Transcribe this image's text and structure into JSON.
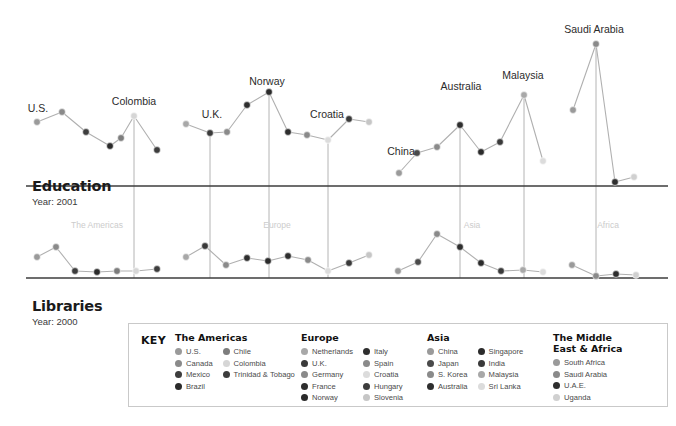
{
  "sections": {
    "education": {
      "title": "Education",
      "year_label": "Year: 2001"
    },
    "libraries": {
      "title": "Libraries",
      "year_label": "Year: 2000"
    }
  },
  "region_bands": [
    "The Americas",
    "Europe",
    "Asia",
    "Africa"
  ],
  "legend": {
    "key_label": "KEY",
    "groups": [
      {
        "heading": "The Americas",
        "columns": [
          [
            {
              "label": "U.S.",
              "color": "#9a9a9a"
            },
            {
              "label": "Canada",
              "color": "#8a8a8a"
            },
            {
              "label": "Mexico",
              "color": "#3d3d3d"
            },
            {
              "label": "Brazil",
              "color": "#2b2b2b"
            }
          ],
          [
            {
              "label": "Chile",
              "color": "#7d7d7d"
            },
            {
              "label": "Colombia",
              "color": "#d6d6d6"
            },
            {
              "label": "Trinidad & Tobago",
              "color": "#3d3d3d"
            }
          ]
        ]
      },
      {
        "heading": "Europe",
        "columns": [
          [
            {
              "label": "Netherlands",
              "color": "#a8a8a8"
            },
            {
              "label": "U.K.",
              "color": "#3a3a3a"
            },
            {
              "label": "Germany",
              "color": "#8a8a8a"
            },
            {
              "label": "France",
              "color": "#2e2e2e"
            },
            {
              "label": "Norway",
              "color": "#2b2b2b"
            }
          ],
          [
            {
              "label": "Italy",
              "color": "#2e2e2e"
            },
            {
              "label": "Spain",
              "color": "#8a8a8a"
            },
            {
              "label": "Croatia",
              "color": "#dcdcdc"
            },
            {
              "label": "Hungary",
              "color": "#3d3d3d"
            },
            {
              "label": "Slovenia",
              "color": "#c6c6c6"
            }
          ]
        ]
      },
      {
        "heading": "Asia",
        "columns": [
          [
            {
              "label": "China",
              "color": "#9a9a9a"
            },
            {
              "label": "Japan",
              "color": "#4a4a4a"
            },
            {
              "label": "S. Korea",
              "color": "#8a8a8a"
            },
            {
              "label": "Australia",
              "color": "#2e2e2e"
            }
          ],
          [
            {
              "label": "Singapore",
              "color": "#2b2b2b"
            },
            {
              "label": "India",
              "color": "#3a3a3a"
            },
            {
              "label": "Malaysia",
              "color": "#a8a8a8"
            },
            {
              "label": "Sri Lanka",
              "color": "#dcdcdc"
            }
          ]
        ]
      },
      {
        "heading": "The Middle\nEast & Africa",
        "columns": [
          [
            {
              "label": "South Africa",
              "color": "#9a9a9a"
            },
            {
              "label": "Saudi Arabia",
              "color": "#8a8a8a"
            },
            {
              "label": "U.A.E.",
              "color": "#2e2e2e"
            },
            {
              "label": "Uganda",
              "color": "#d0d0d0"
            }
          ]
        ]
      }
    ]
  },
  "chart_data": {
    "type": "line",
    "xlabel": "",
    "ylabel": "",
    "grid": true,
    "legend_position": "bottom",
    "annotations": [
      {
        "text": "U.S.",
        "x": 38,
        "y": 112
      },
      {
        "text": "Colombia",
        "x": 134,
        "y": 105
      },
      {
        "text": "U.K.",
        "x": 212,
        "y": 118
      },
      {
        "text": "Norway",
        "x": 267,
        "y": 85
      },
      {
        "text": "Croatia",
        "x": 327,
        "y": 118
      },
      {
        "text": "China",
        "x": 401,
        "y": 155
      },
      {
        "text": "Australia",
        "x": 461,
        "y": 90
      },
      {
        "text": "Malaysia",
        "x": 523,
        "y": 79
      },
      {
        "text": "Saudi Arabia",
        "x": 594,
        "y": 33
      }
    ],
    "series": [
      {
        "name": "Education",
        "year": 2001,
        "baseline_y": 186,
        "points": [
          {
            "country": "U.S.",
            "region": "The Americas",
            "x": 37,
            "y": 122,
            "color": "#9a9a9a",
            "value": 64
          },
          {
            "country": "Canada",
            "region": "The Americas",
            "x": 62,
            "y": 112,
            "color": "#8a8a8a",
            "value": 74
          },
          {
            "country": "Mexico",
            "region": "The Americas",
            "x": 86,
            "y": 132,
            "color": "#3d3d3d",
            "value": 54
          },
          {
            "country": "Brazil",
            "region": "The Americas",
            "x": 110,
            "y": 146,
            "color": "#2b2b2b",
            "value": 40
          },
          {
            "country": "Chile",
            "region": "The Americas",
            "x": 121,
            "y": 138,
            "color": "#7d7d7d",
            "value": 48
          },
          {
            "country": "Colombia",
            "region": "The Americas",
            "x": 134,
            "y": 116,
            "color": "#d6d6d6",
            "value": 70
          },
          {
            "country": "Trinidad & Tobago",
            "region": "The Americas",
            "x": 157,
            "y": 150,
            "color": "#3d3d3d",
            "value": 36
          },
          {
            "country": "Netherlands",
            "region": "Europe",
            "x": 186,
            "y": 124,
            "color": "#a8a8a8",
            "value": 62
          },
          {
            "country": "U.K.",
            "region": "Europe",
            "x": 210,
            "y": 133,
            "color": "#3a3a3a",
            "value": 53
          },
          {
            "country": "Germany",
            "region": "Europe",
            "x": 227,
            "y": 132,
            "color": "#8a8a8a",
            "value": 54
          },
          {
            "country": "France",
            "region": "Europe",
            "x": 247,
            "y": 105,
            "color": "#2e2e2e",
            "value": 81
          },
          {
            "country": "Norway",
            "region": "Europe",
            "x": 269,
            "y": 92,
            "color": "#2b2b2b",
            "value": 94
          },
          {
            "country": "Italy",
            "region": "Europe",
            "x": 288,
            "y": 132,
            "color": "#2e2e2e",
            "value": 54
          },
          {
            "country": "Spain",
            "region": "Europe",
            "x": 307,
            "y": 135,
            "color": "#8a8a8a",
            "value": 51
          },
          {
            "country": "Croatia",
            "region": "Europe",
            "x": 328,
            "y": 140,
            "color": "#dcdcdc",
            "value": 46
          },
          {
            "country": "Hungary",
            "region": "Europe",
            "x": 349,
            "y": 119,
            "color": "#3a3a3a",
            "value": 67
          },
          {
            "country": "Slovenia",
            "region": "Europe",
            "x": 369,
            "y": 122,
            "color": "#c6c6c6",
            "value": 64
          },
          {
            "country": "China",
            "region": "Asia",
            "x": 399,
            "y": 173,
            "color": "#9a9a9a",
            "value": 13
          },
          {
            "country": "Japan",
            "region": "Asia",
            "x": 417,
            "y": 153,
            "color": "#4a4a4a",
            "value": 33
          },
          {
            "country": "S. Korea",
            "region": "Asia",
            "x": 437,
            "y": 147,
            "color": "#8a8a8a",
            "value": 39
          },
          {
            "country": "Australia",
            "region": "Asia",
            "x": 460,
            "y": 125,
            "color": "#2e2e2e",
            "value": 61
          },
          {
            "country": "Singapore",
            "region": "Asia",
            "x": 481,
            "y": 152,
            "color": "#2b2b2b",
            "value": 34
          },
          {
            "country": "India",
            "region": "Asia",
            "x": 500,
            "y": 142,
            "color": "#3a3a3a",
            "value": 44
          },
          {
            "country": "Malaysia",
            "region": "Asia",
            "x": 524,
            "y": 95,
            "color": "#a8a8a8",
            "value": 91
          },
          {
            "country": "Sri Lanka",
            "region": "Asia",
            "x": 543,
            "y": 161,
            "color": "#dcdcdc",
            "value": 25
          },
          {
            "country": "South Africa",
            "region": "Africa",
            "x": 573,
            "y": 110,
            "color": "#9a9a9a",
            "value": 76
          },
          {
            "country": "Saudi Arabia",
            "region": "Africa",
            "x": 596,
            "y": 44,
            "color": "#8a8a8a",
            "value": 142
          },
          {
            "country": "U.A.E.",
            "region": "Africa",
            "x": 615,
            "y": 182,
            "color": "#2e2e2e",
            "value": 4
          },
          {
            "country": "Uganda",
            "region": "Africa",
            "x": 634,
            "y": 177,
            "color": "#d0d0d0",
            "value": 9
          }
        ]
      },
      {
        "name": "Libraries",
        "year": 2000,
        "baseline_y": 278,
        "points": [
          {
            "country": "U.S.",
            "region": "The Americas",
            "x": 37,
            "y": 257,
            "color": "#9a9a9a",
            "value": 21
          },
          {
            "country": "Canada",
            "region": "The Americas",
            "x": 56,
            "y": 247,
            "color": "#8a8a8a",
            "value": 31
          },
          {
            "country": "Mexico",
            "region": "The Americas",
            "x": 75,
            "y": 271,
            "color": "#3d3d3d",
            "value": 7
          },
          {
            "country": "Brazil",
            "region": "The Americas",
            "x": 97,
            "y": 272,
            "color": "#2b2b2b",
            "value": 6
          },
          {
            "country": "Chile",
            "region": "The Americas",
            "x": 117,
            "y": 271,
            "color": "#7d7d7d",
            "value": 7
          },
          {
            "country": "Colombia",
            "region": "The Americas",
            "x": 136,
            "y": 271,
            "color": "#d6d6d6",
            "value": 7
          },
          {
            "country": "Trinidad & Tobago",
            "region": "The Americas",
            "x": 157,
            "y": 269,
            "color": "#3d3d3d",
            "value": 9
          },
          {
            "country": "Netherlands",
            "region": "Europe",
            "x": 186,
            "y": 257,
            "color": "#a8a8a8",
            "value": 21
          },
          {
            "country": "U.K.",
            "region": "Europe",
            "x": 205,
            "y": 246,
            "color": "#3a3a3a",
            "value": 32
          },
          {
            "country": "Germany",
            "region": "Europe",
            "x": 226,
            "y": 265,
            "color": "#8a8a8a",
            "value": 13
          },
          {
            "country": "France",
            "region": "Europe",
            "x": 247,
            "y": 258,
            "color": "#2e2e2e",
            "value": 20
          },
          {
            "country": "Norway",
            "region": "Europe",
            "x": 268,
            "y": 261,
            "color": "#2b2b2b",
            "value": 17
          },
          {
            "country": "Italy",
            "region": "Europe",
            "x": 288,
            "y": 256,
            "color": "#2e2e2e",
            "value": 22
          },
          {
            "country": "Spain",
            "region": "Europe",
            "x": 308,
            "y": 260,
            "color": "#8a8a8a",
            "value": 18
          },
          {
            "country": "Croatia",
            "region": "Europe",
            "x": 328,
            "y": 271,
            "color": "#dcdcdc",
            "value": 7
          },
          {
            "country": "Hungary",
            "region": "Europe",
            "x": 349,
            "y": 263,
            "color": "#3a3a3a",
            "value": 15
          },
          {
            "country": "Slovenia",
            "region": "Europe",
            "x": 369,
            "y": 255,
            "color": "#c6c6c6",
            "value": 23
          },
          {
            "country": "China",
            "region": "Asia",
            "x": 398,
            "y": 271,
            "color": "#9a9a9a",
            "value": 7
          },
          {
            "country": "Japan",
            "region": "Asia",
            "x": 418,
            "y": 262,
            "color": "#4a4a4a",
            "value": 16
          },
          {
            "country": "S. Korea",
            "region": "Asia",
            "x": 437,
            "y": 234,
            "color": "#8a8a8a",
            "value": 44
          },
          {
            "country": "Australia",
            "region": "Asia",
            "x": 460,
            "y": 247,
            "color": "#2e2e2e",
            "value": 31
          },
          {
            "country": "Singapore",
            "region": "Asia",
            "x": 481,
            "y": 263,
            "color": "#2b2b2b",
            "value": 15
          },
          {
            "country": "India",
            "region": "Asia",
            "x": 501,
            "y": 271,
            "color": "#3a3a3a",
            "value": 7
          },
          {
            "country": "Malaysia",
            "region": "Asia",
            "x": 523,
            "y": 270,
            "color": "#a8a8a8",
            "value": 8
          },
          {
            "country": "Sri Lanka",
            "region": "Asia",
            "x": 543,
            "y": 272,
            "color": "#dcdcdc",
            "value": 6
          },
          {
            "country": "South Africa",
            "region": "Africa",
            "x": 572,
            "y": 265,
            "color": "#9a9a9a",
            "value": 13
          },
          {
            "country": "Saudi Arabia",
            "region": "Africa",
            "x": 596,
            "y": 276,
            "color": "#8a8a8a",
            "value": 2
          },
          {
            "country": "U.A.E.",
            "region": "Africa",
            "x": 616,
            "y": 274,
            "color": "#2e2e2e",
            "value": 4
          },
          {
            "country": "Uganda",
            "region": "Africa",
            "x": 636,
            "y": 275,
            "color": "#d0d0d0",
            "value": 3
          }
        ]
      }
    ],
    "vertical_guides": [
      {
        "label": "Colombia",
        "x": 134,
        "top": 116,
        "bottom": 278
      },
      {
        "label": "U.K.",
        "x": 210,
        "top": 133,
        "bottom": 278
      },
      {
        "label": "Norway",
        "x": 269,
        "top": 92,
        "bottom": 278
      },
      {
        "label": "Croatia",
        "x": 328,
        "top": 140,
        "bottom": 278
      },
      {
        "label": "Australia",
        "x": 460,
        "top": 125,
        "bottom": 278
      },
      {
        "label": "Malaysia",
        "x": 524,
        "top": 95,
        "bottom": 278
      },
      {
        "label": "Saudi Arabia",
        "x": 596,
        "top": 44,
        "bottom": 278
      }
    ],
    "band_labels": [
      {
        "text": "The Americas",
        "x": 97,
        "y": 228
      },
      {
        "text": "Europe",
        "x": 277,
        "y": 228
      },
      {
        "text": "Asia",
        "x": 472,
        "y": 228
      },
      {
        "text": "Africa",
        "x": 608,
        "y": 228
      }
    ]
  }
}
